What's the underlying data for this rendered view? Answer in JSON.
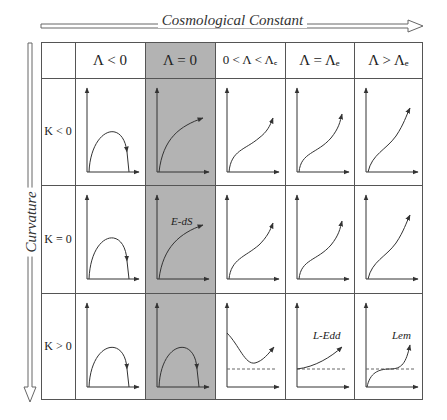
{
  "axes": {
    "horizontal_label": "Cosmological Constant",
    "vertical_label": "Curvature"
  },
  "columns": [
    {
      "label": "Λ < 0"
    },
    {
      "label": "Λ = 0",
      "highlighted": true
    },
    {
      "label": "0 < Λ < Λₑ"
    },
    {
      "label": "Λ = Λₑ"
    },
    {
      "label": "Λ > Λₑ"
    }
  ],
  "rows": [
    {
      "label": "K < 0"
    },
    {
      "label": "K = 0"
    },
    {
      "label": "K > 0"
    }
  ],
  "cells": [
    [
      {
        "curve": "recollapse"
      },
      {
        "curve": "decelerating-expansion"
      },
      {
        "curve": "inflecting-expansion"
      },
      {
        "curve": "inflecting-expansion"
      },
      {
        "curve": "inflecting-expansion"
      }
    ],
    [
      {
        "curve": "recollapse"
      },
      {
        "curve": "decelerating-expansion",
        "label": "E-dS"
      },
      {
        "curve": "inflecting-expansion"
      },
      {
        "curve": "inflecting-expansion"
      },
      {
        "curve": "inflecting-expansion"
      }
    ],
    [
      {
        "curve": "recollapse"
      },
      {
        "curve": "recollapse"
      },
      {
        "curve": "bounce",
        "dashed_asymptote": true
      },
      {
        "curve": "from-static",
        "label": "L-Edd",
        "dashed_asymptote": true
      },
      {
        "curve": "loitering",
        "label": "Lem",
        "dashed_asymptote": true
      }
    ]
  ],
  "colors": {
    "highlight": "#b3b3b3",
    "line": "#555555",
    "curve": "#333333"
  }
}
